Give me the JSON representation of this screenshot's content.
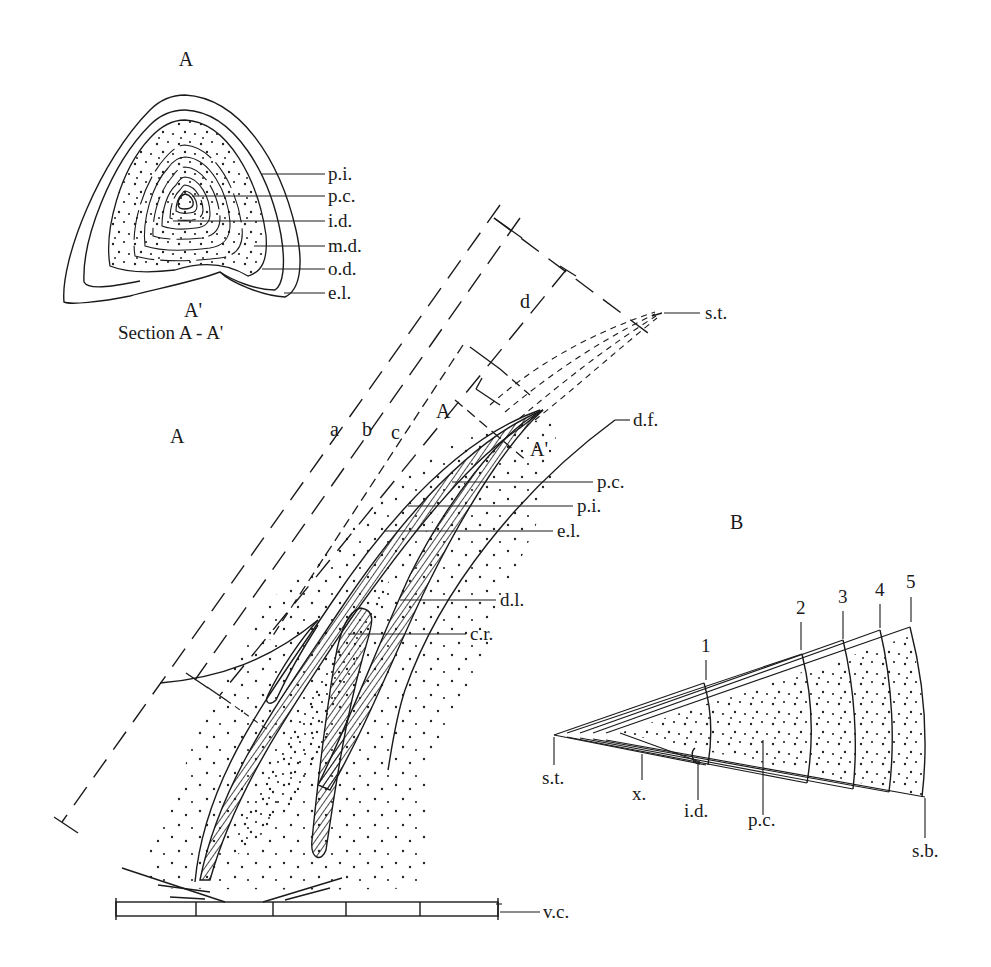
{
  "section": {
    "top_label": "A",
    "bottom_label": "A'",
    "caption": "Section A - A'",
    "labels": [
      "p.i.",
      "p.c.",
      "i.d.",
      "m.d.",
      "o.d.",
      "e.l."
    ]
  },
  "figure_a": {
    "title": "A",
    "dimension_labels": [
      "a",
      "b",
      "c",
      "d"
    ],
    "section_marks": [
      "A",
      "A'"
    ],
    "labels": {
      "st": "s.t.",
      "df": "d.f.",
      "pc": "p.c.",
      "pi": "p.i.",
      "el": "e.l.",
      "dl": "d.l.",
      "cr": "c.r.",
      "vc": "v.c."
    }
  },
  "figure_b": {
    "title": "B",
    "zone_numbers": [
      "1",
      "2",
      "3",
      "4",
      "5"
    ],
    "labels": {
      "st": "s.t.",
      "x": "x.",
      "id": "i.d.",
      "pc": "p.c.",
      "sb": "s.b."
    }
  },
  "colors": {
    "ink": "#1a1a1a",
    "paper": "#ffffff"
  }
}
